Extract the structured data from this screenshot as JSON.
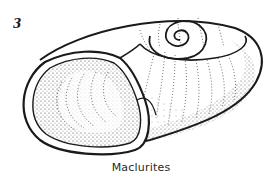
{
  "figure": {
    "number": "3",
    "caption": "Maclurites",
    "colors": {
      "ink": "#1a1a1a",
      "stipple": "#3a3a3a",
      "background": "#ffffff"
    }
  }
}
